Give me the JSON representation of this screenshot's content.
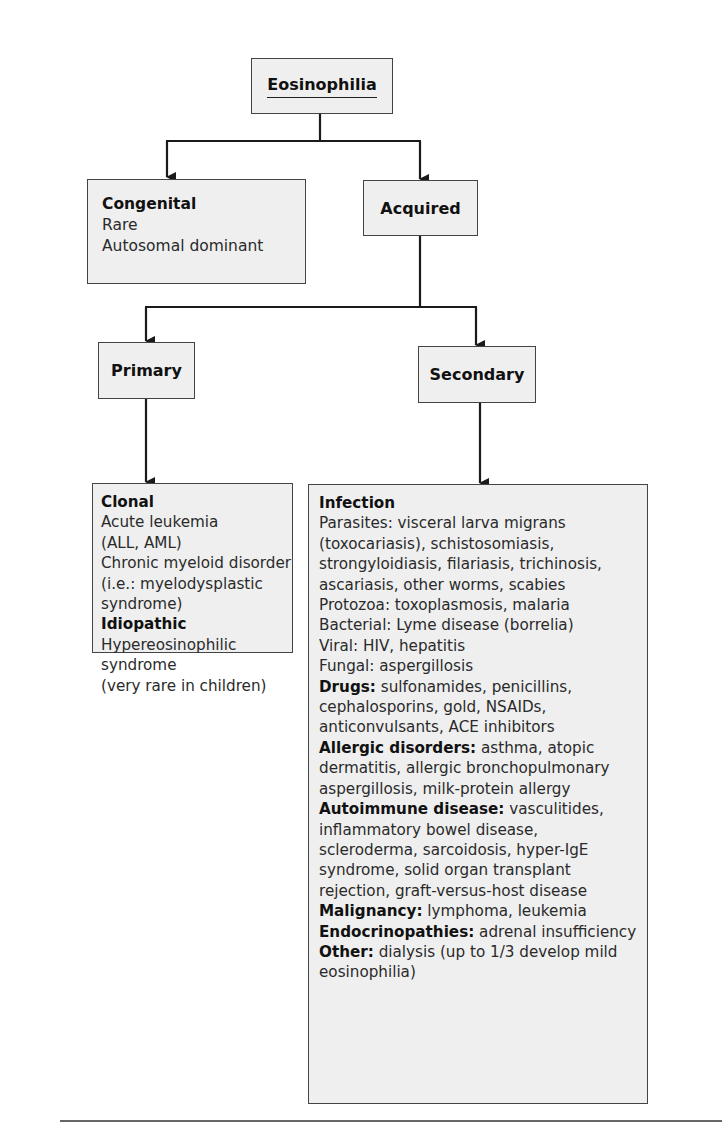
{
  "diagram": {
    "root": {
      "label": "Eosinophilia"
    },
    "level1": {
      "congenital": {
        "title": "Congenital",
        "lines": [
          "Rare",
          "Autosomal dominant"
        ]
      },
      "acquired": {
        "title": "Acquired"
      }
    },
    "level2": {
      "primary": {
        "title": "Primary"
      },
      "secondary": {
        "title": "Secondary"
      }
    },
    "primary_details": {
      "sections": [
        {
          "heading": "Clonal",
          "lines": [
            "Acute leukemia",
            "(ALL, AML)",
            "Chronic myeloid disorder",
            "(i.e.: myelodysplastic",
            "syndrome)"
          ]
        },
        {
          "heading": "Idiopathic",
          "lines": [
            "Hypereosinophilic",
            "syndrome",
            "(very rare in children)"
          ]
        }
      ]
    },
    "secondary_details": {
      "infection": {
        "heading": "Infection",
        "lines": [
          "Parasites: visceral larva migrans",
          "(toxocariasis), schistosomiasis,",
          "strongyloidiasis, filariasis, trichinosis,",
          "ascariasis, other worms, scabies",
          "Protozoa: toxoplasmosis, malaria",
          "Bacterial: Lyme disease (borrelia)",
          "Viral: HIV, hepatitis",
          "Fungal: aspergillosis"
        ]
      },
      "drugs": {
        "label": "Drugs:",
        "lines": [
          " sulfonamides, penicillins,",
          "cephalosporins, gold, NSAIDs,",
          "anticonvulsants, ACE inhibitors"
        ]
      },
      "allergic": {
        "label": "Allergic disorders:",
        "lines": [
          " asthma, atopic",
          "dermatitis, allergic bronchopulmonary",
          "aspergillosis, milk-protein allergy"
        ]
      },
      "autoimmune": {
        "label": "Autoimmune disease:",
        "lines": [
          " vasculitides,",
          "inflammatory bowel disease,",
          "scleroderma, sarcoidosis, hyper-IgE",
          "syndrome, solid organ transplant",
          "rejection, graft-versus-host disease"
        ]
      },
      "malignancy": {
        "label": "Malignancy:",
        "lines": [
          " lymphoma, leukemia"
        ]
      },
      "endocrine": {
        "label": "Endocrinopathies:",
        "lines": [
          " adrenal insufficiency"
        ]
      },
      "other": {
        "label": "Other:",
        "lines": [
          " dialysis (up to 1/3 develop mild",
          "eosinophilia)"
        ]
      }
    }
  },
  "colors": {
    "box_fill": "#efefef",
    "border": "#444444",
    "line": "#1a1a1a",
    "text": "#2a2a2a"
  }
}
